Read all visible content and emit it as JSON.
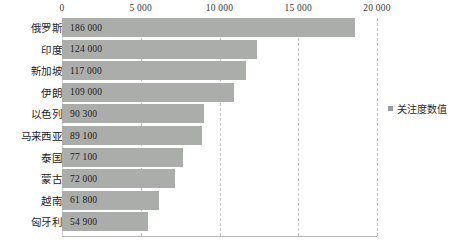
{
  "chart_data": {
    "type": "bar",
    "orientation": "horizontal",
    "title": "",
    "xlabel": "",
    "ylabel": "",
    "categories": [
      "俄罗斯",
      "印度",
      "新加坡",
      "伊朗",
      "以色列",
      "马来西亚",
      "泰国",
      "蒙古",
      "越南",
      "匈牙利"
    ],
    "values": [
      186000,
      124000,
      117000,
      109000,
      90300,
      89100,
      77100,
      72000,
      61800,
      54900
    ],
    "value_labels": [
      "186 000",
      "124 000",
      "117 000",
      "109 000",
      "90 300",
      "89 100",
      "77 100",
      "72 000",
      "61 800",
      "54 900"
    ],
    "bar_scale_divisor": 10,
    "xlim": [
      0,
      20000
    ],
    "xticks": [
      0,
      5000,
      10000,
      15000,
      20000
    ],
    "xtick_labels": [
      "0",
      "5 000",
      "10 000",
      "15 000",
      "20 000"
    ],
    "grid": true,
    "grid_style": "dashed-vertical",
    "legend": {
      "position": "right",
      "entries": [
        "关注度数值"
      ]
    },
    "series": [
      {
        "name": "关注度数值",
        "values": [
          186000,
          124000,
          117000,
          109000,
          90300,
          89100,
          77100,
          72000,
          61800,
          54900
        ]
      }
    ],
    "colors": {
      "bar": "#abadaa",
      "grid": "#c9c9c9",
      "axis": "#b4b4b4",
      "text": "#1f1f1f"
    }
  }
}
